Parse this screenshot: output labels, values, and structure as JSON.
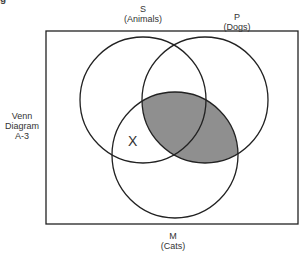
{
  "heading_fragment": "g",
  "side_label": [
    "Venn",
    "Diagram",
    "A-3"
  ],
  "circles": [
    {
      "letter": "S",
      "term": "(Animals)",
      "cx": 143,
      "cy": 100,
      "r": 63
    },
    {
      "letter": "P",
      "term": "(Dogs)",
      "cx": 205,
      "cy": 100,
      "r": 63
    },
    {
      "letter": "M",
      "term": "(Cats)",
      "cx": 175,
      "cy": 155,
      "r": 63
    }
  ],
  "marks": {
    "x_mark": "X",
    "shaded_region": "P ∩ M"
  },
  "colors": {
    "line": "#222222",
    "shade": "#8f8f8f",
    "background": "#ffffff"
  }
}
